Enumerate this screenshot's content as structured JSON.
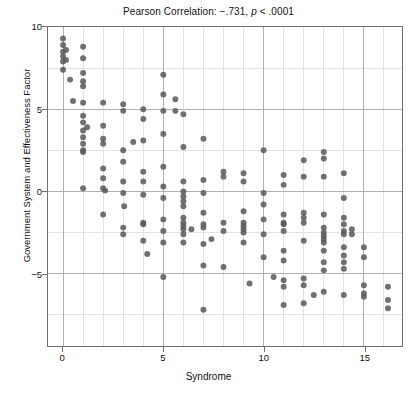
{
  "chart_data": {
    "type": "scatter",
    "title": "Pearson Correlation: −.731, p < .0001",
    "title_prefix": "Pearson Correlation: −.731, ",
    "title_italic": "p",
    "title_suffix": " < .0001",
    "xlabel": "Syndrome",
    "ylabel": "Government System and Effectiveness Factor",
    "xlim": [
      -0.75,
      16.9
    ],
    "ylim": [
      -9.4,
      10.0
    ],
    "xticks": [
      0,
      5,
      10,
      15
    ],
    "xtick_labels": [
      "0",
      "5",
      "10",
      "15"
    ],
    "yticks": [
      10,
      5,
      0,
      -5
    ],
    "ytick_labels": [
      "10",
      "5",
      "0",
      "-5"
    ],
    "x_minor_step": 1,
    "y_minor_step": 2.5,
    "grid": true,
    "grid_major_color": "#b0b0b0",
    "grid_minor_color": "#e2e2e2",
    "marker_color": "#5a5a5a",
    "marker_size": 3.0,
    "legend": null,
    "pearson_r": -0.731,
    "p_value": "< .0001",
    "points": [
      [
        0.0,
        9.3
      ],
      [
        0.0,
        8.9
      ],
      [
        0.0,
        8.5
      ],
      [
        0.0,
        8.2
      ],
      [
        0.0,
        7.9
      ],
      [
        0.0,
        7.4
      ],
      [
        0.15,
        8.6
      ],
      [
        0.15,
        8.0
      ],
      [
        0.35,
        6.8
      ],
      [
        0.5,
        5.5
      ],
      [
        1.0,
        8.8
      ],
      [
        1.0,
        8.1
      ],
      [
        1.0,
        7.2
      ],
      [
        1.0,
        6.7
      ],
      [
        1.0,
        6.4
      ],
      [
        1.0,
        5.4
      ],
      [
        1.0,
        4.6
      ],
      [
        1.0,
        4.2
      ],
      [
        1.0,
        3.7
      ],
      [
        1.0,
        3.3
      ],
      [
        1.0,
        2.9
      ],
      [
        1.0,
        2.5
      ],
      [
        1.0,
        2.4
      ],
      [
        1.2,
        3.9
      ],
      [
        1.0,
        0.2
      ],
      [
        2.0,
        5.4
      ],
      [
        2.0,
        4.0
      ],
      [
        2.0,
        3.2
      ],
      [
        2.0,
        2.9
      ],
      [
        2.0,
        1.4
      ],
      [
        2.0,
        0.8
      ],
      [
        2.0,
        0.2
      ],
      [
        2.1,
        0.05
      ],
      [
        2.0,
        -1.4
      ],
      [
        3.0,
        5.3
      ],
      [
        3.0,
        4.9
      ],
      [
        3.0,
        2.5
      ],
      [
        3.0,
        1.8
      ],
      [
        3.0,
        0.6
      ],
      [
        3.0,
        -0.1
      ],
      [
        3.05,
        -0.9
      ],
      [
        3.0,
        -2.2
      ],
      [
        3.0,
        -2.6
      ],
      [
        3.5,
        3.0
      ],
      [
        4.0,
        5.0
      ],
      [
        4.0,
        4.4
      ],
      [
        4.0,
        3.1
      ],
      [
        4.0,
        1.2
      ],
      [
        4.0,
        0.6
      ],
      [
        4.0,
        -0.2
      ],
      [
        4.0,
        -1.9
      ],
      [
        4.0,
        -2.0
      ],
      [
        4.0,
        -3.0
      ],
      [
        4.2,
        -3.8
      ],
      [
        5.0,
        7.1
      ],
      [
        5.0,
        5.9
      ],
      [
        5.0,
        4.9
      ],
      [
        5.0,
        3.5
      ],
      [
        5.0,
        1.5
      ],
      [
        5.0,
        0.3
      ],
      [
        5.0,
        -0.4
      ],
      [
        5.0,
        -1.7
      ],
      [
        5.0,
        -2.4
      ],
      [
        5.0,
        -3.1
      ],
      [
        5.0,
        -5.2
      ],
      [
        5.6,
        5.6
      ],
      [
        5.6,
        4.9
      ],
      [
        6.0,
        4.7
      ],
      [
        6.0,
        2.7
      ],
      [
        6.0,
        0.6
      ],
      [
        6.0,
        0.0
      ],
      [
        6.0,
        -0.3
      ],
      [
        6.0,
        -0.6
      ],
      [
        6.0,
        -0.9
      ],
      [
        6.0,
        -1.6
      ],
      [
        6.0,
        -1.9
      ],
      [
        6.0,
        -2.1
      ],
      [
        6.0,
        -2.3
      ],
      [
        6.0,
        -2.6
      ],
      [
        6.0,
        -3.1
      ],
      [
        6.4,
        -2.3
      ],
      [
        7.0,
        3.2
      ],
      [
        7.0,
        0.7
      ],
      [
        7.0,
        -0.1
      ],
      [
        7.0,
        -1.3
      ],
      [
        7.0,
        -2.0
      ],
      [
        7.0,
        -2.2
      ],
      [
        7.0,
        -3.2
      ],
      [
        7.0,
        -4.5
      ],
      [
        7.0,
        -7.2
      ],
      [
        7.4,
        -2.9
      ],
      [
        8.0,
        1.2
      ],
      [
        8.0,
        0.9
      ],
      [
        8.0,
        -1.9
      ],
      [
        8.0,
        -2.4
      ],
      [
        8.0,
        -4.6
      ],
      [
        9.0,
        1.1
      ],
      [
        9.0,
        0.6
      ],
      [
        9.0,
        -1.2
      ],
      [
        9.0,
        -1.9
      ],
      [
        9.0,
        -2.1
      ],
      [
        9.0,
        -2.3
      ],
      [
        9.0,
        -2.5
      ],
      [
        9.0,
        -3.1
      ],
      [
        9.3,
        -5.6
      ],
      [
        10.0,
        2.5
      ],
      [
        10.0,
        -0.1
      ],
      [
        10.0,
        -0.8
      ],
      [
        10.0,
        -1.7
      ],
      [
        10.0,
        -2.6
      ],
      [
        10.0,
        -4.0
      ],
      [
        10.5,
        -5.2
      ],
      [
        11.0,
        1.0
      ],
      [
        11.0,
        0.4
      ],
      [
        11.0,
        -1.4
      ],
      [
        11.0,
        -1.9
      ],
      [
        11.0,
        -2.0
      ],
      [
        11.0,
        -2.4
      ],
      [
        11.0,
        -3.6
      ],
      [
        11.0,
        -4.2
      ],
      [
        11.0,
        -5.4
      ],
      [
        11.0,
        -5.8
      ],
      [
        11.0,
        -6.9
      ],
      [
        12.0,
        1.9
      ],
      [
        12.0,
        0.9
      ],
      [
        12.0,
        -1.3
      ],
      [
        12.0,
        -1.6
      ],
      [
        12.0,
        -1.9
      ],
      [
        12.0,
        -3.0
      ],
      [
        12.0,
        -5.3
      ],
      [
        12.0,
        -5.7
      ],
      [
        12.0,
        -6.8
      ],
      [
        12.5,
        -6.3
      ],
      [
        13.0,
        2.4
      ],
      [
        13.0,
        2.0
      ],
      [
        13.0,
        0.9
      ],
      [
        13.0,
        -1.4
      ],
      [
        13.0,
        -2.2
      ],
      [
        13.0,
        -2.5
      ],
      [
        13.0,
        -2.7
      ],
      [
        13.0,
        -2.9
      ],
      [
        13.0,
        -3.1
      ],
      [
        13.0,
        -3.6
      ],
      [
        13.0,
        -4.3
      ],
      [
        13.0,
        -4.8
      ],
      [
        13.0,
        -6.1
      ],
      [
        14.0,
        1.1
      ],
      [
        14.0,
        -0.4
      ],
      [
        14.0,
        -1.6
      ],
      [
        14.0,
        -2.0
      ],
      [
        14.0,
        -2.4
      ],
      [
        14.0,
        -2.6
      ],
      [
        14.0,
        -3.4
      ],
      [
        14.0,
        -3.9
      ],
      [
        14.0,
        -4.3
      ],
      [
        14.0,
        -4.7
      ],
      [
        14.0,
        -6.3
      ],
      [
        14.4,
        -2.3
      ],
      [
        14.4,
        -2.6
      ],
      [
        15.0,
        -3.4
      ],
      [
        15.0,
        -4.0
      ],
      [
        15.0,
        -5.7
      ],
      [
        15.0,
        -6.2
      ],
      [
        15.0,
        -6.4
      ],
      [
        16.2,
        -5.8
      ],
      [
        16.2,
        -6.6
      ],
      [
        16.2,
        -7.1
      ]
    ]
  }
}
